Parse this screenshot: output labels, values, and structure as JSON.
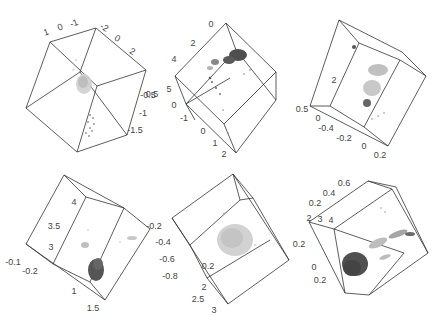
{
  "chart_data": [
    {
      "type": "scatter",
      "subtype": "3d-scatter",
      "panel": "top-left",
      "title": "",
      "axes": [
        {
          "ticks": [
            "1",
            "0",
            "-1"
          ]
        },
        {
          "ticks": [
            "-2",
            "0",
            "2"
          ]
        },
        {
          "ticks": [
            "-0.5",
            "-1",
            "-1.5"
          ]
        }
      ],
      "series": [
        {
          "name": "cluster-center",
          "color": "#bdbdbd",
          "description": "dense light-gray blob near cube center"
        },
        {
          "name": "cluster-lower",
          "color": "#9a9a9a",
          "description": "sparse trail of points toward lower edge"
        }
      ],
      "grid": false,
      "legend": false
    },
    {
      "type": "scatter",
      "subtype": "3d-scatter",
      "panel": "top-middle",
      "axes": [
        {
          "ticks": [
            "0",
            "2",
            "4"
          ]
        },
        {
          "ticks": [
            "5",
            "0",
            "-1"
          ]
        },
        {
          "ticks": [
            "0",
            "1",
            "2"
          ]
        }
      ],
      "series": [
        {
          "name": "dark-cluster",
          "color": "#4a4a4a",
          "description": "dense dark cluster upper right"
        },
        {
          "name": "light-cluster",
          "color": "#b0b0b0",
          "description": "smaller gray cluster left of center"
        },
        {
          "name": "scatter",
          "color": "#777777",
          "description": "sparse points spreading down-left"
        }
      ],
      "grid": false,
      "legend": false
    },
    {
      "type": "scatter",
      "subtype": "3d-scatter",
      "panel": "top-right",
      "axes": [
        {
          "ticks": [
            "2"
          ]
        },
        {
          "ticks": [
            "0.5",
            "0"
          ]
        },
        {
          "ticks": [
            "-0.4",
            "-0.2",
            "0",
            "0.2"
          ]
        }
      ],
      "series": [
        {
          "name": "light-column",
          "color": "#c0c0c0",
          "description": "tall light-gray vertical spread"
        },
        {
          "name": "dark-core",
          "color": "#555555",
          "description": "dark points at bottom of column and small cluster at top-left"
        }
      ],
      "grid": false,
      "legend": false
    },
    {
      "type": "scatter",
      "subtype": "3d-scatter",
      "panel": "bottom-left",
      "axes": [
        {
          "ticks": [
            "4",
            "3.5",
            "3"
          ]
        },
        {
          "ticks": [
            "-0.1",
            "-0.2"
          ]
        },
        {
          "ticks": [
            "1",
            "1.5"
          ]
        }
      ],
      "series": [
        {
          "name": "dark-cluster",
          "color": "#4d4d4d",
          "description": "dense dark cluster lower center"
        },
        {
          "name": "light-points",
          "color": "#bdbdbd",
          "description": "faint scattered points mid and right"
        }
      ],
      "grid": false,
      "legend": false
    },
    {
      "type": "scatter",
      "subtype": "3d-scatter",
      "panel": "bottom-middle",
      "axes": [
        {
          "ticks": [
            "-0.2",
            "-0.4",
            "-0.6",
            "-0.8"
          ]
        },
        {
          "ticks": [
            "0.2"
          ]
        },
        {
          "ticks": [
            "2",
            "2.5",
            "3"
          ]
        }
      ],
      "series": [
        {
          "name": "light-blob",
          "color": "#c4c4c4",
          "description": "single diffuse light-gray blob at center"
        }
      ],
      "grid": false,
      "legend": false
    },
    {
      "type": "scatter",
      "subtype": "3d-scatter",
      "panel": "bottom-right",
      "axes": [
        {
          "ticks": [
            "0.6",
            "0.4",
            "0.2"
          ]
        },
        {
          "ticks": [
            "2",
            "3",
            "4"
          ]
        },
        {
          "ticks": [
            "0.2",
            "0",
            "0.2"
          ]
        }
      ],
      "series": [
        {
          "name": "dark-cluster",
          "color": "#4a4a4a",
          "description": "dense dark cluster lower left"
        },
        {
          "name": "light-trail",
          "color": "#b5b5b5",
          "description": "light trail extending to the upper right"
        },
        {
          "name": "dark-tip",
          "color": "#6a6a6a",
          "description": "darker points at the tip of the trail"
        }
      ],
      "grid": false,
      "legend": false
    }
  ],
  "panels": [
    {
      "ticks": [
        {
          "t": "1",
          "x": 47,
          "y": 35,
          "r": -20
        },
        {
          "t": "0",
          "x": 61,
          "y": 30,
          "r": -20
        },
        {
          "t": "-1",
          "x": 75,
          "y": 26,
          "r": -20
        },
        {
          "t": "-2",
          "x": 103,
          "y": 30,
          "r": 30
        },
        {
          "t": "0",
          "x": 116,
          "y": 41,
          "r": 30
        },
        {
          "t": "2",
          "x": 131,
          "y": 54,
          "r": 30
        },
        {
          "t": "-0.5",
          "x": 148,
          "y": 98,
          "r": 0
        },
        {
          "t": "-1",
          "x": 143,
          "y": 116,
          "r": 0
        },
        {
          "t": "-1.5",
          "x": 135,
          "y": 133,
          "r": 0
        }
      ]
    },
    {
      "ticks": [
        {
          "t": "0",
          "x": 211,
          "y": 27,
          "r": 0
        },
        {
          "t": "2",
          "x": 193,
          "y": 46,
          "r": 0
        },
        {
          "t": "4",
          "x": 174,
          "y": 62,
          "r": 0
        },
        {
          "t": "5",
          "x": 169,
          "y": 92,
          "r": 0
        },
        {
          "t": "0",
          "x": 174,
          "y": 108,
          "r": 0
        },
        {
          "t": "-1",
          "x": 184,
          "y": 121,
          "r": 0
        },
        {
          "t": "0",
          "x": 203,
          "y": 134,
          "r": 0
        },
        {
          "t": "1",
          "x": 215,
          "y": 146,
          "r": 0
        },
        {
          "t": "2",
          "x": 224,
          "y": 157,
          "r": 0
        },
        {
          "t": "0.5",
          "x": 152,
          "y": 97,
          "r": 0
        }
      ]
    },
    {
      "ticks": [
        {
          "t": "2",
          "x": 334,
          "y": 83,
          "r": 0
        },
        {
          "t": "0.5",
          "x": 302,
          "y": 112,
          "r": 0
        },
        {
          "t": "0",
          "x": 318,
          "y": 121,
          "r": 0
        },
        {
          "t": "-0.4",
          "x": 326,
          "y": 131,
          "r": 0
        },
        {
          "t": "-0.2",
          "x": 344,
          "y": 141,
          "r": 0
        },
        {
          "t": "0",
          "x": 364,
          "y": 149,
          "r": 0
        },
        {
          "t": "0.2",
          "x": 380,
          "y": 158,
          "r": 0
        }
      ]
    },
    {
      "ticks": [
        {
          "t": "4",
          "x": 74,
          "y": 205,
          "r": 0
        },
        {
          "t": "3.5",
          "x": 54,
          "y": 229,
          "r": 0
        },
        {
          "t": "3",
          "x": 51,
          "y": 250,
          "r": 0
        },
        {
          "t": "-0.1",
          "x": 13,
          "y": 265,
          "r": 0
        },
        {
          "t": "-0.2",
          "x": 30,
          "y": 274,
          "r": 0
        },
        {
          "t": "1",
          "x": 74,
          "y": 294,
          "r": 0
        },
        {
          "t": "1.5",
          "x": 93,
          "y": 311,
          "r": 0
        }
      ]
    },
    {
      "ticks": [
        {
          "t": "-0.2",
          "x": 154,
          "y": 229,
          "r": 0
        },
        {
          "t": "-0.4",
          "x": 163,
          "y": 245,
          "r": 0
        },
        {
          "t": "-0.6",
          "x": 167,
          "y": 262,
          "r": 0
        },
        {
          "t": "-0.8",
          "x": 170,
          "y": 279,
          "r": 0
        },
        {
          "t": "0.2",
          "x": 208,
          "y": 269,
          "r": 0
        },
        {
          "t": "2",
          "x": 204,
          "y": 290,
          "r": 0
        },
        {
          "t": "2.5",
          "x": 198,
          "y": 302,
          "r": 0
        },
        {
          "t": "3",
          "x": 214,
          "y": 313,
          "r": 0
        }
      ]
    },
    {
      "ticks": [
        {
          "t": "0.6",
          "x": 344,
          "y": 186,
          "r": 0
        },
        {
          "t": "0.4",
          "x": 329,
          "y": 196,
          "r": 0
        },
        {
          "t": "0.2",
          "x": 315,
          "y": 206,
          "r": 0
        },
        {
          "t": "2",
          "x": 309,
          "y": 221,
          "r": 0
        },
        {
          "t": "3",
          "x": 320,
          "y": 222,
          "r": 0
        },
        {
          "t": "4",
          "x": 331,
          "y": 223,
          "r": 0
        },
        {
          "t": "0.2",
          "x": 299,
          "y": 247,
          "r": 0
        },
        {
          "t": "0",
          "x": 314,
          "y": 270,
          "r": 0
        },
        {
          "t": "0.2",
          "x": 320,
          "y": 283,
          "r": 0
        }
      ]
    }
  ]
}
